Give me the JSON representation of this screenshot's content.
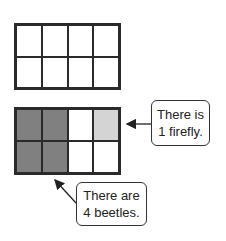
{
  "colors": {
    "beetle": "#808080",
    "firefly": "#d4d4d4",
    "empty": "#ffffff",
    "border": "#2a2a2a"
  },
  "top_grid": {
    "rows": 2,
    "cols": 4,
    "cells": [
      "empty",
      "empty",
      "empty",
      "empty",
      "empty",
      "empty",
      "empty",
      "empty"
    ]
  },
  "bottom_grid": {
    "rows": 2,
    "cols": 4,
    "cells": [
      "beetle",
      "beetle",
      "empty",
      "firefly",
      "beetle",
      "beetle",
      "empty",
      "empty"
    ]
  },
  "callouts": {
    "firefly": {
      "line1": "There is",
      "line2": "1 firefly."
    },
    "beetles": {
      "line1": "There are",
      "line2": "4 beetles."
    }
  }
}
